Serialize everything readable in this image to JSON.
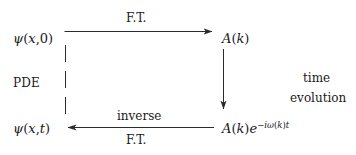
{
  "diagram": {
    "stroke_color": "#2b2b2b",
    "background_color": "#ffffff",
    "nodes": {
      "top_left": {
        "name": "psi-x-0",
        "psi": "ψ",
        "open": "(",
        "var": "x",
        "comma": ",",
        "arg": "0",
        "close": ")"
      },
      "top_right": {
        "name": "A-of-k",
        "A": "A",
        "open": "(",
        "var": "k",
        "close": ")"
      },
      "bottom_left": {
        "name": "psi-x-t",
        "psi": "ψ",
        "open": "(",
        "var": "x",
        "comma": ",",
        "arg": "t",
        "close": ")"
      },
      "bottom_right": {
        "name": "A-of-k-times-phase",
        "A": "A",
        "open1": "(",
        "var1": "k",
        "close1": ")",
        "e": "e",
        "exp_minus": "−",
        "exp_i": "i",
        "exp_omega": "ω",
        "exp_open": "(",
        "exp_k": "k",
        "exp_close": ")",
        "exp_t": "t"
      }
    },
    "edges": {
      "top_arrow": {
        "label": "F.T.",
        "direction": "right"
      },
      "bottom_arrow": {
        "label_above": "inverse",
        "label_below": "F.T.",
        "direction": "left"
      },
      "left_dashed": {
        "label": "PDE",
        "style": "dashed",
        "direction": "down"
      },
      "right_arrow": {
        "label_line1": "time",
        "label_line2": "evolution",
        "direction": "down"
      }
    }
  }
}
